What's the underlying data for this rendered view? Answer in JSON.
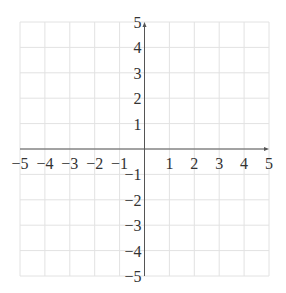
{
  "chart_data": {
    "type": "scatter",
    "title": "",
    "xlabel": "",
    "ylabel": "",
    "xlim": [
      -5,
      5
    ],
    "ylim": [
      -5,
      5
    ],
    "grid": true,
    "legend": null,
    "series": [],
    "x_ticks": [
      -5,
      -4,
      -3,
      -2,
      -1,
      1,
      2,
      3,
      4,
      5
    ],
    "y_ticks": [
      -5,
      -4,
      -3,
      -2,
      -1,
      1,
      2,
      3,
      4,
      5
    ],
    "x_tick_labels": [
      "−5",
      "−4",
      "−3",
      "−2",
      "−1",
      "1",
      "2",
      "3",
      "4",
      "5"
    ],
    "y_tick_labels": [
      "−5",
      "−4",
      "−3",
      "−2",
      "−1",
      "1",
      "2",
      "3",
      "4",
      "5"
    ]
  },
  "colors": {
    "grid": "#e2e2e2",
    "axis": "#555555",
    "label": "#333333"
  }
}
